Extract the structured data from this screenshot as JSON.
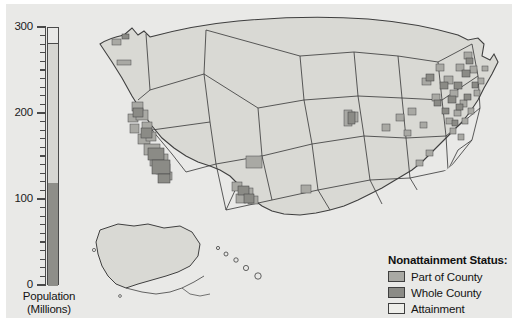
{
  "figure": {
    "background": "#e9e9e7",
    "page_background": "#ffffff"
  },
  "colors": {
    "part_of_county": "#a9a9a4",
    "whole_county": "#8b8b86",
    "attainment": "#e4e4e0",
    "map_land": "#d9d9d4",
    "outline": "#3f3f3f",
    "bar_upper": "#d6d6d2",
    "bar_lower": "#8e8e89",
    "axis": "#4a4a4a",
    "text": "#141414"
  },
  "chart_data": {
    "type": "bar",
    "title": "",
    "xlabel": "",
    "ylabel": "Population (Millions)",
    "ylim": [
      0,
      300
    ],
    "yticks": [
      0,
      100,
      200,
      300
    ],
    "ytick_labels": [
      "0",
      "100",
      "200",
      "300"
    ],
    "minor_tick_interval": 10,
    "grid": false,
    "legend_position": "map-bottom-right",
    "categories": [
      "Population"
    ],
    "segments": [
      {
        "name": "Part of County",
        "from": 8,
        "to": 121,
        "value": 113,
        "color": "#8e8e89"
      },
      {
        "name": "Whole County",
        "from": 0,
        "to": 8,
        "value": 8,
        "color": "#8e8e89"
      },
      {
        "name": "Attainment",
        "from": 121,
        "to": 283,
        "value": 162,
        "color": "#d6d6d2"
      }
    ],
    "total": 283,
    "nonattainment_total": 121
  },
  "axis": {
    "caption_line1": "Population",
    "caption_line2": "(Millions)"
  },
  "legend": {
    "title": "Nonattainment Status:",
    "items": [
      {
        "label": "Part of County",
        "color": "#a9a9a4"
      },
      {
        "label": "Whole County",
        "color": "#8b8b86"
      },
      {
        "label": "Attainment",
        "color": "#eeeeea"
      }
    ]
  },
  "map": {
    "name": "united-states-nonattainment-map",
    "insets": [
      "Alaska",
      "Hawaii"
    ]
  }
}
